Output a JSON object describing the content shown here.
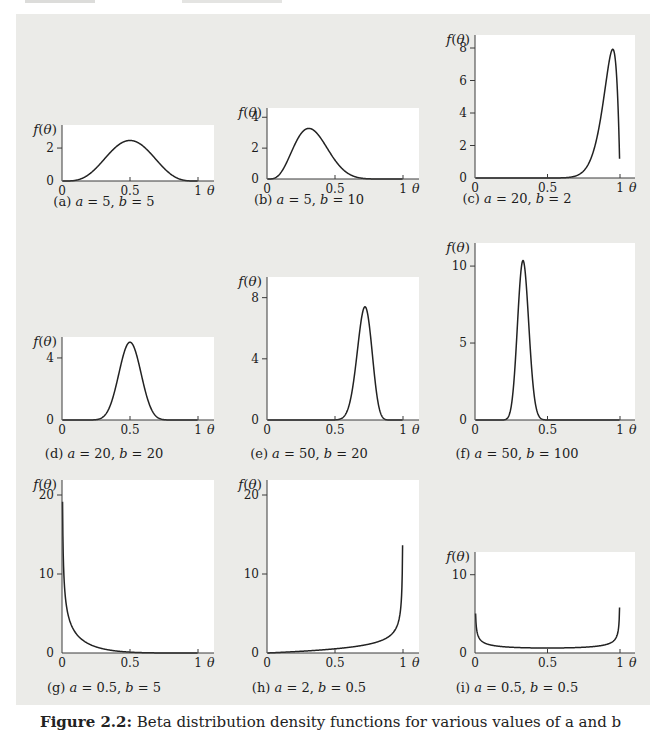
{
  "figure": {
    "caption_label": "Figure 2.2:",
    "caption_text": " Beta distribution density functions for various values of a and b",
    "panel_bg": "#ebebe8",
    "curve_color": "#222222",
    "axis_color": "#3a3a3a",
    "ylabel": "f(θ)",
    "xlabel": "θ"
  },
  "chart_data": [
    {
      "id": "a",
      "panel_label": "(a)",
      "type": "line",
      "distribution": "beta",
      "a": 5,
      "b": 5,
      "xticks": [
        "0",
        "0.5",
        "1"
      ],
      "yticks": [
        0,
        2
      ],
      "xlim": [
        0,
        1
      ],
      "ylim": [
        0,
        3.4
      ],
      "peak_x": 0.5,
      "peak_y": 2.46,
      "shape": "symmetric bell centered at 0.5"
    },
    {
      "id": "b",
      "panel_label": "(b)",
      "type": "line",
      "distribution": "beta",
      "a": 5,
      "b": 10,
      "xticks": [
        "0",
        "0.5",
        "1"
      ],
      "yticks": [
        0,
        2,
        4
      ],
      "xlim": [
        0,
        1
      ],
      "ylim": [
        0,
        4.6
      ],
      "peak_x": 0.31,
      "peak_y": 3.27,
      "shape": "right-skewed bell, mode near 0.3"
    },
    {
      "id": "c",
      "panel_label": "(c)",
      "type": "line",
      "distribution": "beta",
      "a": 20,
      "b": 2,
      "xticks": [
        "0",
        "0.5",
        "1"
      ],
      "yticks": [
        0,
        2,
        4,
        6,
        8
      ],
      "xlim": [
        0,
        1
      ],
      "ylim": [
        0,
        8.8
      ],
      "peak_x": 0.95,
      "peak_y": 7.92,
      "shape": "sharp peak near 0.95, steep drop at 1"
    },
    {
      "id": "d",
      "panel_label": "(d)",
      "type": "line",
      "distribution": "beta",
      "a": 20,
      "b": 20,
      "xticks": [
        "0",
        "0.5",
        "1"
      ],
      "yticks": [
        0,
        4
      ],
      "xlim": [
        0,
        1
      ],
      "ylim": [
        0,
        5.35
      ],
      "peak_x": 0.5,
      "peak_y": 5.05,
      "shape": "narrow symmetric bell at 0.5"
    },
    {
      "id": "e",
      "panel_label": "(e)",
      "type": "line",
      "distribution": "beta",
      "a": 50,
      "b": 20,
      "xticks": [
        "0",
        "0.5",
        "1"
      ],
      "yticks": [
        0,
        4,
        8
      ],
      "xlim": [
        0,
        1
      ],
      "ylim": [
        0,
        9.35
      ],
      "peak_x": 0.72,
      "peak_y": 7.43,
      "shape": "narrow bell, mode near 0.72"
    },
    {
      "id": "f",
      "panel_label": "(f)",
      "type": "line",
      "distribution": "beta",
      "a": 50,
      "b": 100,
      "xticks": [
        "0",
        "0.5",
        "1"
      ],
      "yticks": [
        0,
        5,
        10
      ],
      "xlim": [
        0,
        1
      ],
      "ylim": [
        0,
        11.5
      ],
      "peak_x": 0.33,
      "peak_y": 10.44,
      "shape": "very narrow bell, mode near 0.33"
    },
    {
      "id": "g",
      "panel_label": "(g)",
      "type": "line",
      "distribution": "beta",
      "a": 0.5,
      "b": 5,
      "xticks": [
        "0",
        "0.5",
        "1"
      ],
      "yticks": [
        0,
        10,
        20
      ],
      "xlim": [
        0,
        1
      ],
      "ylim": [
        0,
        21.9
      ],
      "peak_x": 0,
      "peak_y": 19.1,
      "shape": "monotone decreasing, asymptote at 0"
    },
    {
      "id": "h",
      "panel_label": "(h)",
      "type": "line",
      "distribution": "beta",
      "a": 2,
      "b": 0.5,
      "xticks": [
        "0",
        "0.5",
        "1"
      ],
      "yticks": [
        0,
        10,
        20
      ],
      "xlim": [
        0,
        1
      ],
      "ylim": [
        0,
        21.9
      ],
      "peak_x": 1,
      "peak_y": 14.9,
      "shape": "monotone increasing, asymptote at 1"
    },
    {
      "id": "i",
      "panel_label": "(i)",
      "type": "line",
      "distribution": "beta",
      "a": 0.5,
      "b": 0.5,
      "xticks": [
        "0",
        "0.5",
        "1"
      ],
      "yticks": [
        0,
        10
      ],
      "xlim": [
        0,
        1
      ],
      "ylim": [
        0,
        12.9
      ],
      "peak_x": 0,
      "peak_y": 5.5,
      "shape": "U-shaped, asymptotes at both 0 and 1"
    }
  ]
}
